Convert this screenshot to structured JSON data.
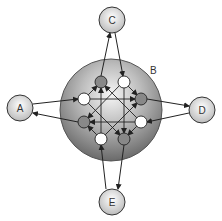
{
  "diagram": {
    "central_region": {
      "label": "B"
    },
    "outer_nodes": [
      {
        "id": "A",
        "label": "A"
      },
      {
        "id": "C",
        "label": "C"
      },
      {
        "id": "D",
        "label": "D"
      },
      {
        "id": "E",
        "label": "E"
      }
    ],
    "inner_nodes": [
      {
        "id": "g1",
        "fill": "gray"
      },
      {
        "id": "w1",
        "fill": "white"
      },
      {
        "id": "g2",
        "fill": "gray"
      },
      {
        "id": "w2",
        "fill": "white"
      },
      {
        "id": "g3",
        "fill": "gray"
      },
      {
        "id": "w3",
        "fill": "white"
      },
      {
        "id": "g4",
        "fill": "gray"
      },
      {
        "id": "w4",
        "fill": "white"
      }
    ],
    "colors": {
      "gray_node": "#888888",
      "white_node": "#ffffff",
      "stroke": "#222222"
    }
  }
}
